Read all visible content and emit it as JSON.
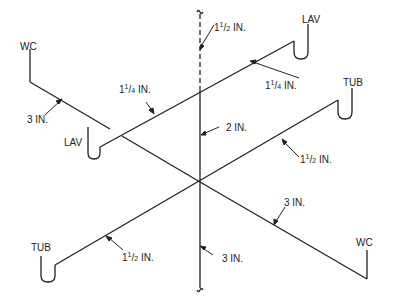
{
  "diagram": {
    "type": "isometric plumbing drainage riser diagram",
    "fixtures": {
      "wc_left": "WC",
      "lav_left": "LAV",
      "tub_left": "TUB",
      "lav_right": "LAV",
      "tub_right": "TUB",
      "wc_right": "WC"
    },
    "sizes": {
      "vent_top": {
        "whole": "1",
        "num": "1",
        "den": "2",
        "unit": "IN."
      },
      "lav_upper_left": {
        "whole": "1",
        "num": "1",
        "den": "4",
        "unit": "IN."
      },
      "lav_upper_right": {
        "whole": "1",
        "num": "1",
        "den": "4",
        "unit": "IN."
      },
      "wc_left": {
        "text": "3 IN."
      },
      "stack_upper": {
        "text": "2 IN."
      },
      "tub_right": {
        "whole": "1",
        "num": "1",
        "den": "2",
        "unit": "IN."
      },
      "wc_right": {
        "text": "3 IN."
      },
      "tub_left": {
        "whole": "1",
        "num": "1",
        "den": "2",
        "unit": "IN."
      },
      "stack_lower": {
        "text": "3 IN."
      }
    },
    "colors": {
      "line": "#222222",
      "background": "#ffffff"
    }
  }
}
